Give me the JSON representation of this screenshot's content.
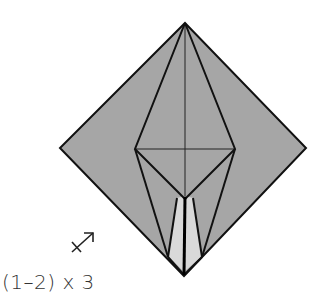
{
  "diagram": {
    "type": "origami-fold-step",
    "colors": {
      "paper": "#a6a6a6",
      "flap": "#d9d9d9",
      "line": "#111111",
      "background": "#ffffff"
    },
    "points": {
      "top": [
        185,
        23
      ],
      "left": [
        60,
        148
      ],
      "right": [
        306,
        148
      ],
      "bottom": [
        184,
        276
      ],
      "kite_left": [
        135,
        149
      ],
      "kite_right": [
        235,
        149
      ],
      "kite_bottom": [
        185,
        199
      ]
    }
  },
  "annotation": {
    "step_label": "(1–2) x 3",
    "icon": "turn-over-arrow-icon"
  }
}
